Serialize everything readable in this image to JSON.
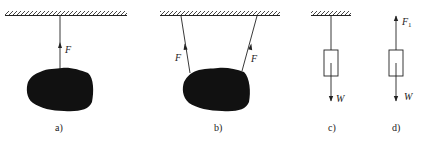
{
  "diagram": {
    "type": "free-body force diagrams",
    "panels": [
      {
        "id": "a",
        "caption": "a)",
        "description": "Rock hanging from ceiling by a single vertical rope",
        "forces": [
          {
            "label": "F",
            "direction": "up"
          }
        ]
      },
      {
        "id": "b",
        "caption": "b)",
        "description": "Rock hanging from ceiling by two inclined ropes",
        "forces": [
          {
            "label": "F",
            "direction": "up-left"
          },
          {
            "label": "F",
            "direction": "up-right"
          }
        ]
      },
      {
        "id": "c",
        "caption": "c)",
        "description": "Block hanging from ceiling with weight shown downward",
        "forces": [
          {
            "label": "W",
            "direction": "down"
          }
        ]
      },
      {
        "id": "d",
        "caption": "d)",
        "description": "Free-body diagram of block with tension F1 up and weight W down",
        "forces": [
          {
            "label": "F",
            "subscript": "1",
            "direction": "up"
          },
          {
            "label": "W",
            "direction": "down"
          }
        ]
      }
    ],
    "colors": {
      "ink": "#222222",
      "mass": "#111111",
      "background": "#ffffff"
    }
  },
  "labels": {
    "a_F": "F",
    "b_F_left": "F",
    "b_F_right": "F",
    "c_W": "W",
    "d_F": "F",
    "d_F_sub": "1",
    "d_W": "W",
    "cap_a": "a)",
    "cap_b": "b)",
    "cap_c": "c)",
    "cap_d": "d)"
  }
}
